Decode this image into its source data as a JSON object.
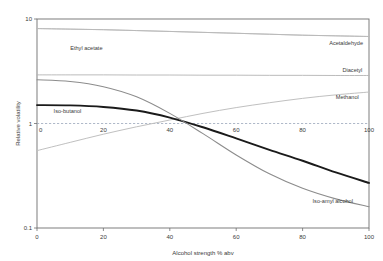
{
  "chart_data": {
    "type": "line",
    "title": "",
    "xlabel": "Alcohol strength % abv",
    "ylabel": "Relative volatility",
    "xlim": [
      0,
      100
    ],
    "ylim": [
      0.1,
      10
    ],
    "yscale": "log",
    "xscale": "linear",
    "grid": false,
    "legend_position": "inline-right",
    "xticks": [
      0,
      20,
      40,
      60,
      80,
      100
    ],
    "xtick_labels": [
      "0",
      "20",
      "40",
      "60",
      "80",
      "100"
    ],
    "yticks": [
      0.1,
      1,
      10
    ],
    "ytick_labels": [
      "0.1",
      "1",
      "10"
    ],
    "secondary_axis": {
      "at_y": 1,
      "style": "dashed",
      "color": "#9aa7bb",
      "ticks": [
        0,
        20,
        40,
        60,
        80,
        100
      ],
      "tick_labels": [
        "0",
        "20",
        "40",
        "60",
        "80",
        "100"
      ]
    },
    "annotations": [
      {
        "text": "Ethyl acetate",
        "x": 10,
        "y": 5.0
      },
      {
        "text": "Iso-butanol",
        "x": 5,
        "y": 1.25
      },
      {
        "text": "Acetaldehyde",
        "x": 88,
        "y": 5.6
      },
      {
        "text": "Diacetyl",
        "x": 92,
        "y": 3.1
      },
      {
        "text": "Methanol",
        "x": 90,
        "y": 1.72
      },
      {
        "text": "Iso-amyl alcohol",
        "x": 83,
        "y": 0.175
      }
    ],
    "x": [
      0,
      10,
      20,
      30,
      40,
      50,
      60,
      70,
      80,
      90,
      100
    ],
    "series": [
      {
        "name": "Acetaldehyde",
        "color": "#b9b9b9",
        "width": 0.9,
        "values": [
          8.1,
          8.0,
          7.9,
          7.75,
          7.6,
          7.45,
          7.3,
          7.15,
          7.0,
          6.9,
          6.8
        ]
      },
      {
        "name": "Ethyl acetate",
        "color": "#b9b9b9",
        "width": 0.9,
        "values": [
          8.1,
          8.0,
          7.9,
          7.75,
          7.6,
          7.45,
          7.3,
          7.15,
          7.0,
          6.9,
          6.8
        ]
      },
      {
        "name": "Diacetyl",
        "color": "#b3b3b3",
        "width": 0.9,
        "values": [
          2.92,
          2.92,
          2.92,
          2.91,
          2.91,
          2.9,
          2.9,
          2.89,
          2.89,
          2.88,
          2.88
        ]
      },
      {
        "name": "Methanol",
        "color": "#c0c0c0",
        "width": 1.0,
        "values": [
          0.55,
          0.66,
          0.79,
          0.93,
          1.08,
          1.25,
          1.42,
          1.58,
          1.74,
          1.88,
          2.0
        ]
      },
      {
        "name": "Iso-butanol",
        "color": "#1a1a1a",
        "width": 1.9,
        "values": [
          1.5,
          1.49,
          1.44,
          1.33,
          1.14,
          0.92,
          0.72,
          0.56,
          0.44,
          0.34,
          0.27
        ]
      },
      {
        "name": "Iso-amyl alcohol",
        "color": "#8c8c8c",
        "width": 1.1,
        "values": [
          2.62,
          2.52,
          2.25,
          1.8,
          1.25,
          0.8,
          0.5,
          0.33,
          0.24,
          0.19,
          0.16
        ]
      }
    ]
  }
}
